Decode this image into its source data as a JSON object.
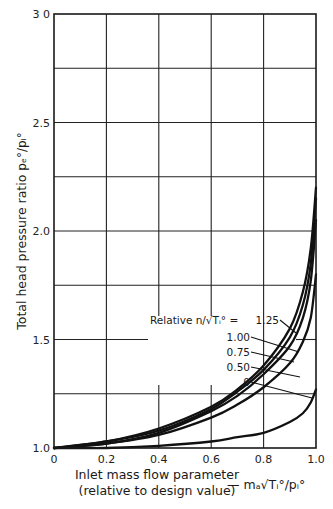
{
  "chart_data": {
    "type": "line",
    "title": "",
    "xlabel": "Inlet mass flow parameter (relative to design value) — m_a√(T_i°)/p_i°",
    "xlabel_line1": "Inlet mass flow parameter",
    "xlabel_line2": "(relative to design value)",
    "xlabel_formula": "— mₐ√Tᵢ°/pᵢ°",
    "ylabel": "Total head pressure ratio p_e°/p_i°",
    "ylabel_text": "Total head pressure ratio ",
    "ylabel_formula": "pₑ°/pᵢ°",
    "xlim": [
      0,
      1.0
    ],
    "ylim": [
      1.0,
      3.0
    ],
    "x_ticks": [
      "0",
      "0.2",
      "0.4",
      "0.6",
      "0.8",
      "1.0"
    ],
    "y_ticks": [
      "1.0",
      "1.5",
      "2.0",
      "2.5",
      "3 0"
    ],
    "grid": true,
    "grid_x_step": 0.2,
    "grid_y_step": 0.25,
    "legend": {
      "title": "Relative n/√Tᵢ° =",
      "entries": [
        "1.25",
        "1.00",
        "0.75",
        "0.50",
        "0"
      ],
      "position": "inside, right-center"
    },
    "series": [
      {
        "name": "1.25",
        "x": [
          0,
          0.2,
          0.4,
          0.6,
          0.7,
          0.8,
          0.9,
          0.95,
          0.98,
          1.0
        ],
        "y": [
          1.0,
          1.03,
          1.09,
          1.19,
          1.27,
          1.38,
          1.55,
          1.72,
          1.92,
          2.2
        ]
      },
      {
        "name": "1.00",
        "x": [
          0,
          0.2,
          0.4,
          0.6,
          0.7,
          0.8,
          0.9,
          0.95,
          0.98,
          1.0
        ],
        "y": [
          1.0,
          1.03,
          1.08,
          1.18,
          1.26,
          1.36,
          1.51,
          1.66,
          1.85,
          2.15
        ]
      },
      {
        "name": "0.75",
        "x": [
          0,
          0.2,
          0.4,
          0.6,
          0.7,
          0.8,
          0.9,
          0.95,
          0.98,
          1.0
        ],
        "y": [
          1.0,
          1.02,
          1.07,
          1.17,
          1.24,
          1.34,
          1.47,
          1.6,
          1.77,
          2.05
        ]
      },
      {
        "name": "0.50",
        "x": [
          0,
          0.2,
          0.4,
          0.6,
          0.7,
          0.8,
          0.9,
          0.95,
          0.98,
          1.0
        ],
        "y": [
          1.0,
          1.02,
          1.06,
          1.14,
          1.2,
          1.28,
          1.39,
          1.49,
          1.6,
          1.8
        ]
      },
      {
        "name": "0",
        "x": [
          0,
          0.2,
          0.4,
          0.6,
          0.7,
          0.8,
          0.9,
          0.95,
          0.98,
          1.0
        ],
        "y": [
          1.0,
          1.0,
          1.01,
          1.03,
          1.05,
          1.07,
          1.12,
          1.16,
          1.21,
          1.27
        ]
      }
    ]
  }
}
